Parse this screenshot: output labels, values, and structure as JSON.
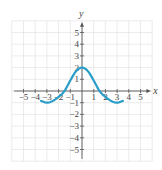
{
  "chart_data": {
    "type": "line",
    "title": "",
    "xlabel": "x",
    "ylabel": "y",
    "xlim": [
      -5.8,
      5.8
    ],
    "ylim": [
      -6,
      6
    ],
    "grid": true,
    "x_ticks": [
      -5,
      -4,
      -3,
      -2,
      -1,
      1,
      2,
      3,
      4,
      5
    ],
    "y_ticks": [
      -5,
      -4,
      -3,
      -2,
      -1,
      1,
      2,
      3,
      4,
      5
    ],
    "x_tick_labels": [
      "−5",
      "−4",
      "−3",
      "−2",
      "−1",
      "1",
      "2",
      "3",
      "4",
      "5"
    ],
    "y_tick_labels": [
      "−5",
      "−4",
      "−3",
      "−2",
      "−1",
      "1",
      "2",
      "3",
      "4",
      "5"
    ],
    "series": [
      {
        "name": "f(x)",
        "color": "#2a9ec9",
        "x": [
          -3.5,
          -3,
          -2.5,
          -2,
          -1.5,
          -1,
          -0.5,
          0,
          0.5,
          1,
          1.5,
          2,
          2.5,
          3,
          3.5
        ],
        "y": [
          -0.85,
          -1,
          -0.85,
          -0.5,
          0,
          0.9,
          1.7,
          2,
          1.7,
          0.9,
          0,
          -0.5,
          -0.85,
          -1,
          -0.85
        ]
      }
    ],
    "colors": {
      "curve": "#2a9ec9",
      "axes": "#555555",
      "grid": "#dddddd",
      "text": "#444444"
    }
  }
}
